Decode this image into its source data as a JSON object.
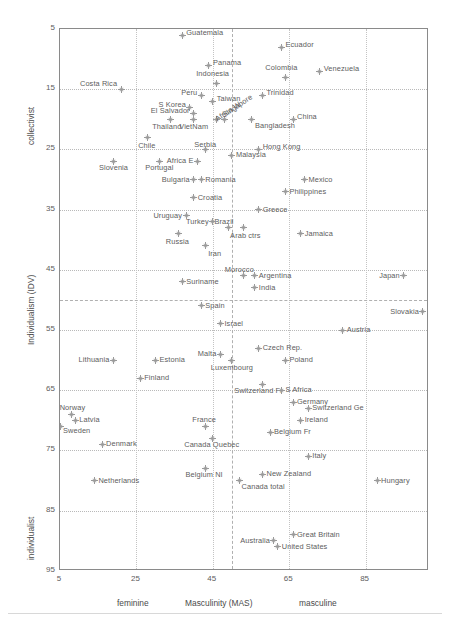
{
  "chart_data": {
    "type": "scatter",
    "title": "",
    "xlabel": "Masculinity (MAS)",
    "ylabel": "Individualism (IDV)",
    "xlim": [
      5,
      101
    ],
    "ylim": [
      5,
      95
    ],
    "y_axis_inverted": true,
    "grid": true,
    "legend": null,
    "xticks": [
      5,
      25,
      45,
      65,
      85
    ],
    "yticks": [
      5,
      15,
      25,
      35,
      45,
      55,
      65,
      75,
      85,
      95
    ],
    "x_axis_low_label": "feminine",
    "x_axis_high_label": "masculine",
    "y_axis_low_label": "collectivist",
    "y_axis_high_label": "individualist",
    "reference_lines": {
      "vertical_mas": 50,
      "horizontal_idv": 50
    },
    "points": [
      {
        "name": "Guatemala",
        "x": 37,
        "y": 6,
        "lx": 4,
        "ly": -3
      },
      {
        "name": "Ecuador",
        "x": 63,
        "y": 8,
        "lx": 4,
        "ly": -3
      },
      {
        "name": "Panama",
        "x": 44,
        "y": 11,
        "lx": 4,
        "ly": -3
      },
      {
        "name": "Venezuela",
        "x": 73,
        "y": 12,
        "lx": 4,
        "ly": -3
      },
      {
        "name": "Colombia",
        "x": 64,
        "y": 13,
        "lx": -4,
        "ly": -10,
        "anchor": "mid"
      },
      {
        "name": "Indonesia",
        "x": 46,
        "y": 14,
        "lx": -4,
        "ly": -10,
        "anchor": "mid"
      },
      {
        "name": "Costa Rica",
        "x": 21,
        "y": 15,
        "lx": -4,
        "ly": -6,
        "anchor": "end"
      },
      {
        "name": "Taiwan",
        "x": 45,
        "y": 17,
        "lx": 4,
        "ly": -3
      },
      {
        "name": "Peru",
        "x": 42,
        "y": 16,
        "lx": -4,
        "ly": -3,
        "anchor": "end"
      },
      {
        "name": "Trinidad",
        "x": 58,
        "y": 16,
        "lx": 4,
        "ly": -3
      },
      {
        "name": "S Korea",
        "x": 39,
        "y": 18,
        "lx": -4,
        "ly": -3,
        "anchor": "end"
      },
      {
        "name": "Singapore",
        "x": 48,
        "y": 20,
        "rot": -34,
        "lx": -1,
        "ly": -4
      },
      {
        "name": "El Salvador",
        "x": 40,
        "y": 19,
        "lx": -4,
        "ly": -3,
        "anchor": "end"
      },
      {
        "name": "China",
        "x": 66,
        "y": 20,
        "lx": 4,
        "ly": -3
      },
      {
        "name": "Thailand",
        "x": 34,
        "y": 20,
        "lx": -4,
        "ly": 7,
        "anchor": "mid"
      },
      {
        "name": "VietNam",
        "x": 40,
        "y": 20,
        "lx": 0,
        "ly": 7,
        "anchor": "mid"
      },
      {
        "name": "Africa W",
        "x": 46,
        "y": 20,
        "rot": -34,
        "lx": -1,
        "ly": 0
      },
      {
        "name": "Bangladesh",
        "x": 55,
        "y": 20,
        "lx": 4,
        "ly": 6
      },
      {
        "name": "Chile",
        "x": 28,
        "y": 23,
        "lx": -1,
        "ly": 8,
        "anchor": "mid"
      },
      {
        "name": "Serbia",
        "x": 43,
        "y": 25,
        "lx": 0,
        "ly": -5,
        "anchor": "mid"
      },
      {
        "name": "Hong Kong",
        "x": 57,
        "y": 25,
        "lx": 4,
        "ly": -3
      },
      {
        "name": "Malaysia",
        "x": 50,
        "y": 26,
        "lx": 4,
        "ly": -1
      },
      {
        "name": "Africa E",
        "x": 41,
        "y": 27,
        "lx": -4,
        "ly": -1,
        "anchor": "end"
      },
      {
        "name": "Slovenia",
        "x": 19,
        "y": 27,
        "lx": 0,
        "ly": 6,
        "anchor": "mid"
      },
      {
        "name": "Portugal",
        "x": 31,
        "y": 27,
        "lx": 0,
        "ly": 6,
        "anchor": "mid"
      },
      {
        "name": "Romania",
        "x": 42,
        "y": 30,
        "lx": 4,
        "ly": -1
      },
      {
        "name": "Bulgaria",
        "x": 40,
        "y": 30,
        "lx": -4,
        "ly": -1,
        "anchor": "end"
      },
      {
        "name": "Mexico",
        "x": 69,
        "y": 30,
        "lx": 4,
        "ly": -1
      },
      {
        "name": "Philippines",
        "x": 64,
        "y": 32,
        "lx": 4,
        "ly": -1
      },
      {
        "name": "Croatia",
        "x": 40,
        "y": 33,
        "lx": 4,
        "ly": -1
      },
      {
        "name": "Greece",
        "x": 57,
        "y": 35,
        "lx": 4,
        "ly": -1
      },
      {
        "name": "Uruguay",
        "x": 38,
        "y": 36,
        "lx": -4,
        "ly": -1,
        "anchor": "end"
      },
      {
        "name": "Brazil",
        "x": 49,
        "y": 38,
        "lx": -4,
        "ly": -7,
        "anchor": "mid"
      },
      {
        "name": "Turkey",
        "x": 45,
        "y": 37,
        "lx": -4,
        "ly": -1,
        "anchor": "end"
      },
      {
        "name": "Arab ctrs",
        "x": 53,
        "y": 38,
        "lx": 2,
        "ly": 7,
        "anchor": "mid"
      },
      {
        "name": "Russia",
        "x": 36,
        "y": 39,
        "lx": -1,
        "ly": 7,
        "anchor": "mid"
      },
      {
        "name": "Jamaica",
        "x": 68,
        "y": 39,
        "lx": 4,
        "ly": -1
      },
      {
        "name": "Iran",
        "x": 43,
        "y": 41,
        "lx": 3,
        "ly": 7
      },
      {
        "name": "Morocco",
        "x": 53,
        "y": 46,
        "lx": -4,
        "ly": -7,
        "anchor": "mid"
      },
      {
        "name": "Argentina",
        "x": 56,
        "y": 46,
        "lx": 4,
        "ly": -1
      },
      {
        "name": "Japan",
        "x": 95,
        "y": 46,
        "lx": -4,
        "ly": -1,
        "anchor": "end"
      },
      {
        "name": "Suriname",
        "x": 37,
        "y": 47,
        "lx": 4,
        "ly": -1
      },
      {
        "name": "India",
        "x": 56,
        "y": 48,
        "lx": 4,
        "ly": -1
      },
      {
        "name": "Spain",
        "x": 42,
        "y": 51,
        "lx": 4,
        "ly": -1
      },
      {
        "name": "Slovakia",
        "x": 100,
        "y": 52,
        "lx": -4,
        "ly": -1,
        "anchor": "end"
      },
      {
        "name": "Israel",
        "x": 47,
        "y": 54,
        "lx": 4,
        "ly": -1
      },
      {
        "name": "Austria",
        "x": 79,
        "y": 55,
        "lx": 4,
        "ly": -1
      },
      {
        "name": "Czech Rep.",
        "x": 57,
        "y": 58,
        "lx": 4,
        "ly": -1
      },
      {
        "name": "Malta",
        "x": 47,
        "y": 59,
        "lx": -4,
        "ly": -1,
        "anchor": "end"
      },
      {
        "name": "Lithuania",
        "x": 19,
        "y": 60,
        "lx": -4,
        "ly": -1,
        "anchor": "end"
      },
      {
        "name": "Estonia",
        "x": 30,
        "y": 60,
        "lx": 4,
        "ly": -1
      },
      {
        "name": "Poland",
        "x": 64,
        "y": 60,
        "lx": 4,
        "ly": -1
      },
      {
        "name": "Luxembourg",
        "x": 50,
        "y": 60,
        "lx": 0,
        "ly": 7,
        "anchor": "mid"
      },
      {
        "name": "Finland",
        "x": 26,
        "y": 63,
        "lx": 4,
        "ly": -1
      },
      {
        "name": "Switzerland Fr",
        "x": 58,
        "y": 64,
        "lx": -4,
        "ly": 6,
        "anchor": "mid"
      },
      {
        "name": "S Africa",
        "x": 63,
        "y": 65,
        "lx": 4,
        "ly": -1
      },
      {
        "name": "Germany",
        "x": 66,
        "y": 67,
        "lx": 4,
        "ly": -1
      },
      {
        "name": "Switzerland Ge",
        "x": 70,
        "y": 68,
        "lx": 4,
        "ly": -1
      },
      {
        "name": "Norway",
        "x": 8,
        "y": 69,
        "lx": 1,
        "ly": -7,
        "anchor": "mid"
      },
      {
        "name": "Ireland",
        "x": 68,
        "y": 70,
        "lx": 4,
        "ly": -1
      },
      {
        "name": "Latvia",
        "x": 9,
        "y": 70,
        "lx": 4,
        "ly": -1
      },
      {
        "name": "France",
        "x": 43,
        "y": 71,
        "lx": -1,
        "ly": -7,
        "anchor": "mid"
      },
      {
        "name": "Sweden",
        "x": 5,
        "y": 71,
        "lx": 3,
        "ly": 4
      },
      {
        "name": "Belgium Fr",
        "x": 60,
        "y": 72,
        "lx": 4,
        "ly": -1
      },
      {
        "name": "Denmark",
        "x": 16,
        "y": 74,
        "lx": 4,
        "ly": -1
      },
      {
        "name": "Canada Quebec",
        "x": 45,
        "y": 73,
        "lx": -1,
        "ly": 6,
        "anchor": "mid"
      },
      {
        "name": "Italy",
        "x": 70,
        "y": 76,
        "lx": 4,
        "ly": -1
      },
      {
        "name": "Belgium NI",
        "x": 43,
        "y": 78,
        "lx": -1,
        "ly": 6,
        "anchor": "mid"
      },
      {
        "name": "New Zealand",
        "x": 58,
        "y": 79,
        "lx": 4,
        "ly": -1
      },
      {
        "name": "Hungary",
        "x": 88,
        "y": 80,
        "lx": 4,
        "ly": -1
      },
      {
        "name": "Netherlands",
        "x": 14,
        "y": 80,
        "lx": 4,
        "ly": -1
      },
      {
        "name": "Canada total",
        "x": 52,
        "y": 80,
        "lx": 2,
        "ly": 5
      },
      {
        "name": "Great Britain",
        "x": 66,
        "y": 89,
        "lx": 4,
        "ly": -1
      },
      {
        "name": "Australia",
        "x": 61,
        "y": 90,
        "lx": -4,
        "ly": -1,
        "anchor": "end"
      },
      {
        "name": "United States",
        "x": 62,
        "y": 91,
        "lx": 4,
        "ly": -1
      }
    ]
  }
}
